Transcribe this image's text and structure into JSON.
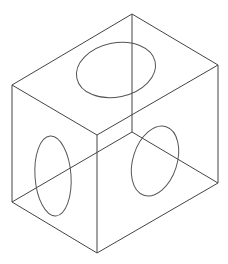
{
  "diagram": {
    "type": "isometric-wireframe-box",
    "colors": {
      "background": "#ffffff",
      "edge": "#444444",
      "hole": "#555555"
    },
    "vertices": {
      "top_back": [
        132,
        14
      ],
      "top_left": [
        12,
        85
      ],
      "top_right": [
        218,
        65
      ],
      "top_front": [
        97,
        135
      ],
      "bottom_back": [
        132,
        132
      ],
      "bottom_left": [
        12,
        202
      ],
      "bottom_right": [
        218,
        183
      ],
      "bottom_front": [
        97,
        253
      ]
    },
    "holes": [
      {
        "face": "top",
        "cx": 116,
        "cy": 70,
        "rx": 40,
        "ry": 27,
        "rotate": -12
      },
      {
        "face": "left",
        "cx": 53,
        "cy": 176,
        "rx": 18,
        "ry": 40,
        "rotate": -4
      },
      {
        "face": "right",
        "cx": 155,
        "cy": 161,
        "rx": 22,
        "ry": 36,
        "rotate": 18
      }
    ]
  }
}
